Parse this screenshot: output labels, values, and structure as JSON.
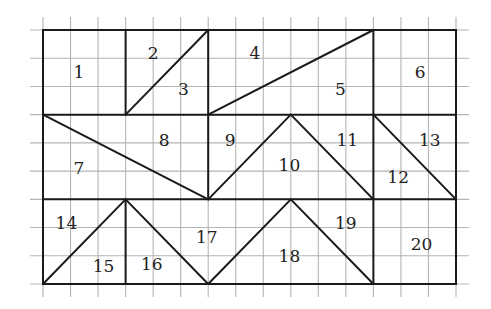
{
  "diagram": {
    "grid": {
      "columns": 15,
      "rows": 9
    },
    "colors": {
      "grid": "#b5b5b5",
      "lines": "#1a1a1a",
      "text": "#222222"
    },
    "segments": [
      [
        0,
        3,
        15,
        3
      ],
      [
        0,
        6,
        15,
        6
      ],
      [
        3,
        0,
        3,
        3
      ],
      [
        6,
        0,
        6,
        3
      ],
      [
        12,
        0,
        12,
        3
      ],
      [
        3,
        3,
        6,
        0
      ],
      [
        6,
        3,
        12,
        0
      ],
      [
        0,
        3,
        6,
        6
      ],
      [
        6,
        3,
        6,
        6
      ],
      [
        6,
        6,
        9,
        3
      ],
      [
        9,
        3,
        12,
        6
      ],
      [
        12,
        3,
        12,
        6
      ],
      [
        12,
        3,
        15,
        6
      ],
      [
        0,
        9,
        3,
        6
      ],
      [
        3,
        6,
        6,
        9
      ],
      [
        3,
        6,
        3,
        9
      ],
      [
        6,
        9,
        9,
        6
      ],
      [
        9,
        6,
        12,
        9
      ],
      [
        12,
        6,
        12,
        9
      ]
    ],
    "pieces": [
      {
        "label": "1",
        "at": [
          1.3,
          1.5
        ]
      },
      {
        "label": "2",
        "at": [
          4.0,
          0.8
        ]
      },
      {
        "label": "3",
        "at": [
          5.1,
          2.1
        ]
      },
      {
        "label": "4",
        "at": [
          7.7,
          0.8
        ]
      },
      {
        "label": "5",
        "at": [
          10.8,
          2.1
        ]
      },
      {
        "label": "6",
        "at": [
          13.7,
          1.5
        ]
      },
      {
        "label": "7",
        "at": [
          1.3,
          4.9
        ]
      },
      {
        "label": "8",
        "at": [
          4.4,
          3.9
        ]
      },
      {
        "label": "9",
        "at": [
          6.8,
          3.9
        ]
      },
      {
        "label": "10",
        "at": [
          8.95,
          4.8
        ]
      },
      {
        "label": "11",
        "at": [
          11.05,
          3.9
        ]
      },
      {
        "label": "12",
        "at": [
          12.9,
          5.2
        ]
      },
      {
        "label": "13",
        "at": [
          14.05,
          3.9
        ]
      },
      {
        "label": "14",
        "at": [
          0.85,
          6.85
        ]
      },
      {
        "label": "15",
        "at": [
          2.2,
          8.35
        ]
      },
      {
        "label": "16",
        "at": [
          3.95,
          8.3
        ]
      },
      {
        "label": "17",
        "at": [
          5.95,
          7.35
        ]
      },
      {
        "label": "18",
        "at": [
          8.95,
          8.0
        ]
      },
      {
        "label": "19",
        "at": [
          11.0,
          6.85
        ]
      },
      {
        "label": "20",
        "at": [
          13.75,
          7.6
        ]
      }
    ]
  }
}
